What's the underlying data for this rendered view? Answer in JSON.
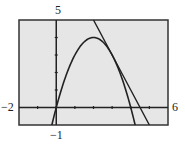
{
  "chart_data": {
    "type": "line",
    "title": "",
    "xlabel": "",
    "ylabel": "",
    "xlim": [
      -2,
      6
    ],
    "ylim": [
      -1,
      5
    ],
    "xscale_ticks": [
      -1,
      0,
      1,
      2,
      3,
      4,
      5
    ],
    "yscale_ticks": [
      1,
      2,
      3,
      4
    ],
    "grid": false,
    "legend": null,
    "window_labels": {
      "xmin": "−2",
      "xmax": "6",
      "ymin": "−1",
      "ymax": "5"
    },
    "series": [
      {
        "name": "parabola",
        "equation": "y = 4x - x^2",
        "x": [
          -0.25,
          0,
          0.5,
          1,
          1.5,
          2,
          2.5,
          3,
          3.5,
          4,
          4.25
        ],
        "values": [
          -1.06,
          0,
          1.75,
          3,
          3.75,
          4,
          3.75,
          3,
          1.75,
          0,
          -1.06
        ]
      },
      {
        "name": "tangent line",
        "equation": "y = -2x + 9",
        "x": [
          2,
          3,
          4,
          5
        ],
        "values": [
          5,
          3,
          1,
          -1
        ]
      }
    ],
    "annotations": [
      "tangent point at (3, 3)"
    ]
  },
  "colors": {
    "background": "#e6e6e6",
    "frame": "#333333",
    "curve": "#222222"
  }
}
